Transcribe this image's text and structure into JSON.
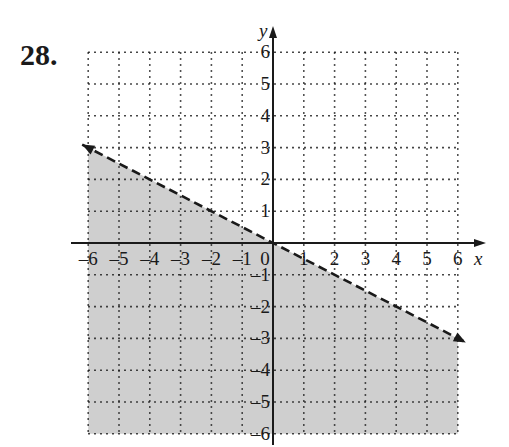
{
  "problem_number": "28.",
  "chart_data": {
    "type": "line",
    "title": "",
    "xlabel": "x",
    "ylabel": "y",
    "xlim": [
      -6,
      6
    ],
    "ylim": [
      -6,
      6
    ],
    "grid": true,
    "grid_style": "dotted",
    "x_ticks": [
      "-6",
      "-5",
      "-4",
      "-3",
      "-2",
      "-1",
      "0",
      "1",
      "2",
      "3",
      "4",
      "5",
      "6"
    ],
    "y_ticks": [
      "-6",
      "-5",
      "-4",
      "-3",
      "-2",
      "-1",
      "1",
      "2",
      "3",
      "4",
      "5",
      "6"
    ],
    "boundary_line": {
      "equation": "y = -x/2",
      "style": "dashed",
      "points": [
        [
          -6,
          3
        ],
        [
          6,
          -3
        ]
      ],
      "arrows": "both ends"
    },
    "shaded_region": {
      "description": "below the dashed line (y < -x/2)",
      "color": "#cccccc"
    }
  },
  "colors": {
    "shade": "#cfcfcf",
    "ink": "#1a1a1a"
  }
}
